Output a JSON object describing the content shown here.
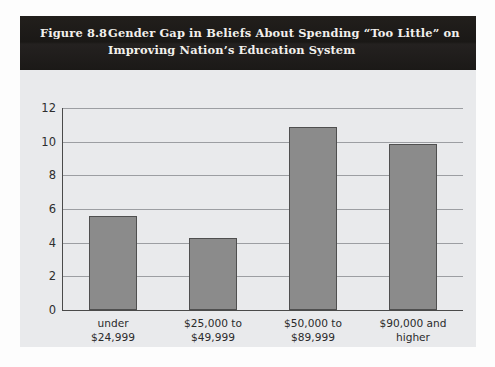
{
  "figure": {
    "number_label": "Figure 8.8",
    "title_line1": "Gender Gap in Beliefs About Spending “Too Little” on",
    "title_line2": "Improving Nation’s Education System",
    "banner_color": "#1c1a18",
    "banner_text_color": "#f2f0ec",
    "card_background": "#e9eaec"
  },
  "chart_data": {
    "type": "bar",
    "xlabel": "",
    "ylabel": "",
    "categories": [
      "under\n$24,999",
      "$25,000 to\n$49,999",
      "$50,000 to\n$89,999",
      "$90,000 and\nhigher"
    ],
    "values": [
      5.6,
      4.3,
      10.9,
      9.85
    ],
    "ylim": [
      0,
      12
    ],
    "ytick_values": [
      0,
      2,
      4,
      6,
      8,
      10,
      12
    ],
    "ytick_labels": [
      "0",
      "2",
      "4",
      "6",
      "8",
      "10",
      "12"
    ],
    "grid": true,
    "legend": "none",
    "bar_fill_color": "#8b8b8b",
    "bar_border_color": "#4f4f4f",
    "axis_color": "#4a4a4a",
    "gridline_color": "#9c9ea2",
    "plot_background": "#e9eaec"
  }
}
